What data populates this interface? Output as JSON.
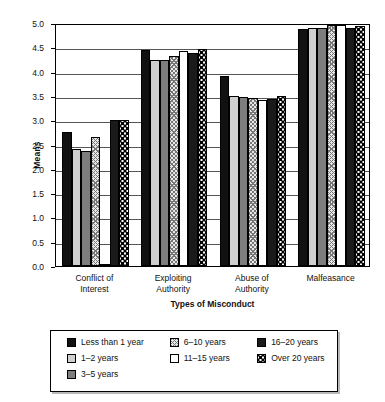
{
  "chart_data": {
    "type": "bar",
    "title": "",
    "xlabel": "Types of Misconduct",
    "ylabel": "Means",
    "ylim": [
      0.0,
      5.0
    ],
    "ytick_labels": [
      "5.0",
      "4.5",
      "4.0",
      "3.5",
      "3.0",
      "2.5",
      "2.0",
      "1.5",
      "1.0",
      "0.5",
      "0.0"
    ],
    "grid": true,
    "legend_position": "bottom",
    "categories": [
      "Conflict of Interest",
      "Exploiting Authority",
      "Abuse of Authority",
      "Malfeasance"
    ],
    "category_lines": [
      [
        "Conflict of",
        "Interest"
      ],
      [
        "Exploiting",
        "Authority"
      ],
      [
        "Abuse of",
        "Authority"
      ],
      [
        "Malfeasance"
      ]
    ],
    "series": [
      {
        "name": "Less than 1 year",
        "pattern": "solid-black",
        "values": [
          2.75,
          4.45,
          3.9,
          4.87
        ]
      },
      {
        "name": "1–2 years",
        "pattern": "light-gray",
        "values": [
          2.4,
          4.23,
          3.5,
          4.9
        ]
      },
      {
        "name": "3–5 years",
        "pattern": "mid-gray",
        "values": [
          2.37,
          4.24,
          3.48,
          4.9
        ]
      },
      {
        "name": "6–10 years",
        "pattern": "crosshatch",
        "values": [
          2.65,
          4.32,
          3.45,
          4.95
        ]
      },
      {
        "name": "11–15 years",
        "pattern": "white",
        "values": [
          0.05,
          4.42,
          3.42,
          4.95
        ]
      },
      {
        "name": "16–20 years",
        "pattern": "dark-solid",
        "values": [
          3.0,
          4.38,
          3.43,
          4.9
        ]
      },
      {
        "name": "Over 20 years",
        "pattern": "dotted",
        "values": [
          3.0,
          4.47,
          3.5,
          4.93
        ]
      }
    ]
  },
  "legend": {
    "columns": [
      [
        {
          "label": "Less than 1 year",
          "pattern": "solid-black"
        },
        {
          "label": "1–2 years",
          "pattern": "light-gray"
        },
        {
          "label": "3–5 years",
          "pattern": "mid-gray"
        }
      ],
      [
        {
          "label": "6–10 years",
          "pattern": "crosshatch"
        },
        {
          "label": "11–15 years",
          "pattern": "white"
        }
      ],
      [
        {
          "label": "16–20 years",
          "pattern": "dark-solid"
        },
        {
          "label": "Over 20 years",
          "pattern": "dotted"
        }
      ]
    ]
  }
}
